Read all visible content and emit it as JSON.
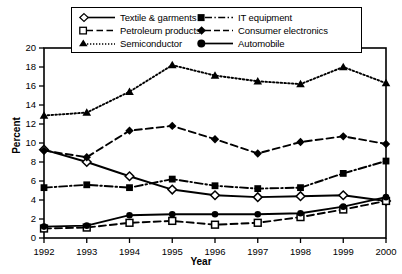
{
  "chart_data": {
    "type": "line",
    "title": "",
    "xlabel": "Year",
    "ylabel": "Percent",
    "categories": [
      "1992",
      "1993",
      "1994",
      "1995",
      "1996",
      "1997",
      "1998",
      "1999",
      "2000"
    ],
    "x": [
      1992,
      1993,
      1994,
      1995,
      1996,
      1997,
      1998,
      1999,
      2000
    ],
    "xlim": [
      1992,
      2000
    ],
    "ylim": [
      0,
      20
    ],
    "yticks": [
      0,
      2,
      4,
      6,
      8,
      10,
      12,
      14,
      16,
      18,
      20
    ],
    "grid": false,
    "legend_position": "top-center",
    "series": [
      {
        "name": "Textile & garments",
        "marker": "open-diamond",
        "line_style": "solid",
        "values": [
          9.3,
          8.0,
          6.5,
          5.1,
          4.5,
          4.3,
          4.4,
          4.5,
          3.9
        ]
      },
      {
        "name": "Petroleum products",
        "marker": "open-square",
        "line_style": "dashed",
        "values": [
          1.0,
          1.1,
          1.6,
          1.8,
          1.4,
          1.6,
          2.2,
          3.0,
          3.9
        ]
      },
      {
        "name": "Semiconductor",
        "marker": "filled-triangle",
        "line_style": "dotted",
        "values": [
          12.9,
          13.2,
          15.4,
          18.2,
          17.1,
          16.5,
          16.2,
          18.0,
          16.3
        ]
      },
      {
        "name": "IT equipment",
        "marker": "filled-square",
        "line_style": "dash-dot",
        "values": [
          5.3,
          5.6,
          5.3,
          6.2,
          5.5,
          5.2,
          5.3,
          6.8,
          8.1
        ]
      },
      {
        "name": "Consumer electronics",
        "marker": "filled-diamond",
        "line_style": "dashed",
        "values": [
          9.2,
          8.5,
          11.3,
          11.8,
          10.4,
          8.9,
          10.1,
          10.7,
          9.9
        ]
      },
      {
        "name": "Automobile",
        "marker": "filled-circle",
        "line_style": "solid",
        "values": [
          1.2,
          1.3,
          2.4,
          2.5,
          2.5,
          2.5,
          2.6,
          3.3,
          4.3
        ]
      }
    ]
  },
  "legend": {
    "entries": [
      {
        "label": "Textile & garments"
      },
      {
        "label": "IT equipment"
      },
      {
        "label": "Petroleum products"
      },
      {
        "label": "Consumer electronics"
      },
      {
        "label": "Semiconductor"
      },
      {
        "label": "Automobile"
      }
    ]
  },
  "axes": {
    "y_title": "Percent",
    "x_title": "Year",
    "y_tick_labels": [
      "0",
      "2",
      "4",
      "6",
      "8",
      "10",
      "12",
      "14",
      "16",
      "18",
      "20"
    ],
    "x_tick_labels": [
      "1992",
      "1993",
      "1994",
      "1995",
      "1996",
      "1997",
      "1998",
      "1999",
      "2000"
    ]
  },
  "colors": {
    "ink": "#000000",
    "background": "#ffffff"
  }
}
